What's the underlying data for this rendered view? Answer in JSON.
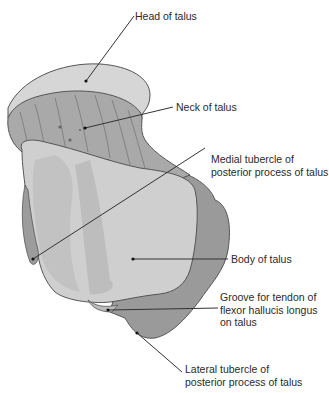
{
  "figure": {
    "labels": [
      {
        "id": "head",
        "lines": [
          "Head of talus"
        ]
      },
      {
        "id": "neck",
        "lines": [
          "Neck of talus"
        ]
      },
      {
        "id": "medial_tubercle",
        "lines": [
          "Medial tubercle of",
          "posterior process of talus"
        ]
      },
      {
        "id": "body",
        "lines": [
          "Body of talus"
        ]
      },
      {
        "id": "groove",
        "lines": [
          "Groove for tendon of",
          "flexor hallucis longus",
          "on talus"
        ]
      },
      {
        "id": "lateral_tubercle",
        "lines": [
          "Lateral tubercle of",
          "posterior process of talus"
        ]
      }
    ]
  },
  "colors": {
    "head": "#d6d6d6",
    "neck": "#a9a9a9",
    "body": "#cfcfcf",
    "body_shade": "#bdbdbd",
    "lateral": "#9a9a9a",
    "outline": "#555555",
    "leader": "#333333"
  }
}
